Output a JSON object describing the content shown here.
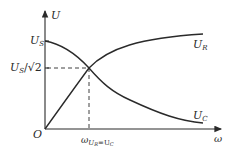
{
  "diagram": {
    "axes": {
      "y_label": "U",
      "x_label": "ω",
      "origin_label": "O"
    },
    "y_ticks": {
      "us": {
        "main": "U",
        "sub": "S"
      },
      "us_sqrt2": {
        "main": "U",
        "sub": "S",
        "rest": "/√2"
      }
    },
    "x_ticks": {
      "omega_cross": {
        "main": "ω",
        "sub": "U",
        "sub2": "R",
        "eq": "=U",
        "sub3": "C"
      }
    },
    "curves": {
      "ur": {
        "main": "U",
        "sub": "R"
      },
      "uc": {
        "main": "U",
        "sub": "C"
      }
    },
    "colors": {
      "ink": "#2a2a2a",
      "background": "#ffffff"
    }
  }
}
